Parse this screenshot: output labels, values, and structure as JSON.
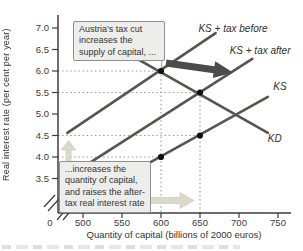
{
  "figure": {
    "y_axis_label": "Real interest rate (per cent per year)",
    "x_axis_label": "Quantity of capital (billions of 2000 euros)"
  },
  "annotations": {
    "top_callout": {
      "lines": [
        "Austria's tax cut",
        "increases the",
        "supply of capital, ..."
      ]
    },
    "bottom_callout": {
      "lines": [
        "...increases the",
        "quantity of capital,",
        "and raises the after-",
        "tax real interest rate"
      ]
    }
  },
  "arrows": {
    "supply_shift": {
      "direction": "right",
      "color": "#4b4b49"
    },
    "quantity_increase": {
      "direction": "right",
      "color": "#dadac8"
    },
    "rate_rise": {
      "direction": "up",
      "color": "#dadac8"
    }
  },
  "colors": {
    "curve": "#58544f",
    "axis": "#3c3c3c",
    "reference": "#999999",
    "dot": "#111111",
    "leader": "#a0a0a0"
  },
  "chart_data": {
    "type": "line",
    "title": "",
    "xlabel": "Quantity of capital (billions of 2000 euros)",
    "ylabel": "Real interest rate (per cent per year)",
    "x_ticks": [
      0,
      500,
      550,
      600,
      650,
      700,
      750
    ],
    "y_ticks": [
      7.0,
      6.5,
      6.0,
      5.5,
      5.0,
      4.5,
      4.0,
      3.5
    ],
    "xlim": [
      480,
      765
    ],
    "ylim": [
      3.3,
      7.3
    ],
    "axis_breaks": {
      "x": true,
      "y": true
    },
    "legend_position": "labels-at-line-ends",
    "grid": false,
    "series": [
      {
        "name": "KS + tax before",
        "points": [
          [
            480,
            4.56
          ],
          [
            670,
            6.88
          ]
        ],
        "label_anchor": [
          648,
          6.98
        ]
      },
      {
        "name": "KS + tax after",
        "points": [
          [
            510,
            3.88
          ],
          [
            717,
            6.28
          ]
        ],
        "label_anchor": [
          688,
          6.47
        ]
      },
      {
        "name": "KS",
        "points": [
          [
            555,
            3.56
          ],
          [
            737,
            5.4
          ]
        ],
        "label_anchor": [
          744,
          5.63
        ]
      },
      {
        "name": "KD",
        "points": [
          [
            522,
            6.77
          ],
          [
            737,
            4.56
          ]
        ],
        "label_anchor": [
          737,
          4.42
        ]
      }
    ],
    "key_points": [
      {
        "q": 600,
        "r": 6.0
      },
      {
        "q": 650,
        "r": 5.5
      },
      {
        "q": 650,
        "r": 4.5
      },
      {
        "q": 600,
        "r": 4.0
      }
    ],
    "reference_lines": {
      "horizontal": [
        {
          "r": 6.0,
          "to_q": 600
        },
        {
          "r": 5.5,
          "to_q": 650
        },
        {
          "r": 4.5,
          "to_q": 650
        },
        {
          "r": 4.0,
          "to_q": 600
        }
      ],
      "vertical": [
        {
          "q": 600,
          "from_r": 6.0
        },
        {
          "q": 650,
          "from_r": 5.5
        }
      ]
    }
  }
}
